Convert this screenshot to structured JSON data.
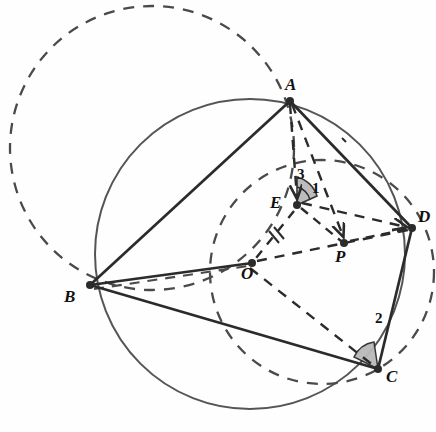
{
  "figure": {
    "width": 436,
    "height": 432,
    "background": "#fefefe",
    "stroke_solid": "#2b2b2b",
    "stroke_dashed": "#4a4a4a",
    "circle_solid_color": "#555555",
    "angle_fill": "#b9b9b9"
  },
  "points": {
    "A": {
      "label": "A",
      "x": 290,
      "y": 101,
      "label_x": 285,
      "label_y": 76
    },
    "B": {
      "label": "B",
      "x": 90,
      "y": 285,
      "label_x": 64,
      "label_y": 288
    },
    "C": {
      "label": "C",
      "x": 378,
      "y": 369,
      "label_x": 386,
      "label_y": 368
    },
    "D": {
      "label": "D",
      "x": 412,
      "y": 228,
      "label_x": 418,
      "label_y": 208
    },
    "E": {
      "label": "E",
      "x": 297,
      "y": 205,
      "label_x": 270,
      "label_y": 194
    },
    "O": {
      "label": "O",
      "x": 252,
      "y": 263,
      "label_x": 241,
      "label_y": 265
    },
    "P": {
      "label": "P",
      "x": 344,
      "y": 243,
      "label_x": 335,
      "label_y": 248
    }
  },
  "angles": [
    {
      "label": "1",
      "vertex": "E",
      "x": 312,
      "y": 181,
      "description": "angle at E between EA-ray and ED-ray"
    },
    {
      "label": "2",
      "vertex": "C",
      "x": 378,
      "y": 311,
      "description": "angle at C between CB and CD"
    },
    {
      "label": "3",
      "vertex": "E",
      "x": 300,
      "y": 170,
      "description": "angle at E left of the EA ray"
    }
  ],
  "circles": [
    {
      "name": "circumcircle-ABCD",
      "style": "solid",
      "cx": 250,
      "cy": 254,
      "r": 155
    },
    {
      "name": "dashed-circle-upper-left",
      "style": "dashed",
      "cx": 152,
      "cy": 148,
      "r": 142
    },
    {
      "name": "dashed-circle-EOCD",
      "style": "dashed",
      "cx": 322,
      "cy": 272,
      "r": 112
    }
  ],
  "solid_segments": [
    {
      "name": "segment-AB",
      "from": "A",
      "to": "B"
    },
    {
      "name": "segment-BO",
      "from": "B",
      "to": "O"
    },
    {
      "name": "segment-BC",
      "from": "B",
      "to": "C"
    },
    {
      "name": "segment-CD",
      "from": "C",
      "to": "D"
    },
    {
      "name": "segment-DA",
      "from": "D",
      "to": "A"
    }
  ],
  "dashed_segments": [
    {
      "name": "segment-AE",
      "from": "A",
      "to": "E"
    },
    {
      "name": "segment-AP",
      "from": "A",
      "to": "P"
    },
    {
      "name": "segment-ED",
      "from": "E",
      "to": "D"
    },
    {
      "name": "segment-EP",
      "from": "E",
      "to": "P"
    },
    {
      "name": "segment-PD",
      "from": "P",
      "to": "D"
    },
    {
      "name": "segment-EO",
      "from": "E",
      "to": "O"
    },
    {
      "name": "segment-OC",
      "from": "O",
      "to": "C"
    },
    {
      "name": "segment-OD",
      "from": "O",
      "to": "D"
    },
    {
      "name": "segment-BD-partial",
      "from": "B",
      "to": "O"
    }
  ],
  "tick_marks": [
    {
      "name": "double-tick-EO",
      "on": "segment-EO",
      "count": 2
    }
  ],
  "arrow_marks": [
    {
      "name": "arrow-on-AE",
      "target": "E"
    },
    {
      "name": "arrow-on-AP",
      "target": "P"
    },
    {
      "name": "arrow-on-ED",
      "target": "D"
    }
  ]
}
